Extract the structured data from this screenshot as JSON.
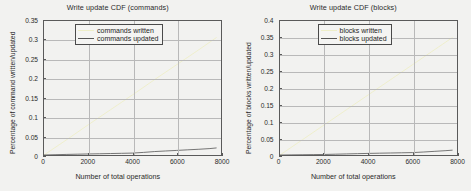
{
  "figure": {
    "background": "#f2f2f0",
    "axis_color": "#5a5a5a",
    "grid_color": "#b9b9b9"
  },
  "panels": [
    {
      "id": "commands",
      "title": "Write update CDF (commands)",
      "xlabel": "Number of total operations",
      "ylabel": "Percentage of command written/updated",
      "legend": [
        {
          "label": "commands written",
          "color": "#eeeec8"
        },
        {
          "label": "commands updated",
          "color": "#555555"
        }
      ],
      "yticks": [
        "0",
        "0.05",
        "0.1",
        "0.15",
        "0.2",
        "0.25",
        "0.3",
        "0.35"
      ],
      "xticks": [
        "0",
        "2000",
        "4000",
        "6000",
        "8000"
      ]
    },
    {
      "id": "blocks",
      "title": "Write update CDF (blocks)",
      "xlabel": "Number of total operations",
      "ylabel": "Percentage of blocks written/updated",
      "legend": [
        {
          "label": "blocks written",
          "color": "#eeeec8"
        },
        {
          "label": "blocks updated",
          "color": "#555555"
        }
      ],
      "yticks": [
        "0",
        "0.05",
        "0.1",
        "0.15",
        "0.2",
        "0.25",
        "0.3",
        "0.35",
        "0.4"
      ],
      "xticks": [
        "0",
        "2000",
        "4000",
        "6000",
        "8000"
      ]
    }
  ],
  "chart_data": [
    {
      "type": "line",
      "title": "Write update CDF (commands)",
      "xlabel": "Number of total operations",
      "ylabel": "Percentage of command written/updated",
      "xlim": [
        0,
        8000
      ],
      "ylim": [
        0,
        0.35
      ],
      "xticks": [
        0,
        2000,
        4000,
        6000,
        8000
      ],
      "yticks": [
        0,
        0.05,
        0.1,
        0.15,
        0.2,
        0.25,
        0.3,
        0.35
      ],
      "grid": true,
      "legend_position": "top-right",
      "series": [
        {
          "name": "commands written",
          "color": "#eeeec8",
          "x": [
            0,
            1000,
            2000,
            3000,
            4000,
            5000,
            6000,
            7000,
            7800
          ],
          "values": [
            0.0,
            0.039,
            0.079,
            0.118,
            0.157,
            0.197,
            0.236,
            0.275,
            0.307
          ]
        },
        {
          "name": "commands updated",
          "color": "#555555",
          "x": [
            0,
            500,
            1000,
            1500,
            2000,
            2500,
            3000,
            3500,
            4000,
            4500,
            5000,
            5500,
            6000,
            6500,
            7000,
            7500,
            7800
          ],
          "values": [
            0.0,
            0.0008,
            0.0015,
            0.0021,
            0.0027,
            0.0032,
            0.0038,
            0.0044,
            0.005,
            0.0068,
            0.009,
            0.0105,
            0.012,
            0.0135,
            0.015,
            0.0168,
            0.0185
          ]
        }
      ]
    },
    {
      "type": "line",
      "title": "Write update CDF (blocks)",
      "xlabel": "Number of total operations",
      "ylabel": "Percentage of blocks written/updated",
      "xlim": [
        0,
        8000
      ],
      "ylim": [
        0,
        0.4
      ],
      "xticks": [
        0,
        2000,
        4000,
        6000,
        8000
      ],
      "yticks": [
        0,
        0.05,
        0.1,
        0.15,
        0.2,
        0.25,
        0.3,
        0.35,
        0.4
      ],
      "grid": true,
      "legend_position": "top-right",
      "series": [
        {
          "name": "blocks written",
          "color": "#eeeec8",
          "x": [
            0,
            1000,
            2000,
            3000,
            4000,
            5000,
            6000,
            7000,
            7800
          ],
          "values": [
            0.0,
            0.045,
            0.09,
            0.135,
            0.18,
            0.225,
            0.27,
            0.315,
            0.351
          ]
        },
        {
          "name": "blocks updated",
          "color": "#555555",
          "x": [
            0,
            500,
            1000,
            1500,
            2000,
            2500,
            3000,
            3500,
            4000,
            4500,
            5000,
            5500,
            6000,
            6500,
            7000,
            7500,
            7800
          ],
          "values": [
            0.0,
            0.0004,
            0.0008,
            0.0012,
            0.0016,
            0.0024,
            0.0032,
            0.004,
            0.0048,
            0.0054,
            0.006,
            0.0066,
            0.0072,
            0.009,
            0.011,
            0.013,
            0.0145
          ]
        }
      ]
    }
  ]
}
